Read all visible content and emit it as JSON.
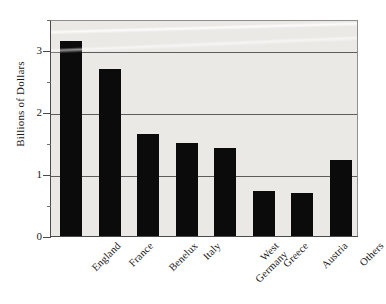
{
  "chart_data": {
    "type": "bar",
    "title": "",
    "subtitle": "",
    "xlabel": "",
    "ylabel": "Billions of Dollars",
    "categories": [
      "England",
      "France",
      "Benelux",
      "Italy",
      "West Germany",
      "Greece",
      "Austria",
      "Others"
    ],
    "values": [
      3.15,
      2.7,
      1.65,
      1.5,
      1.42,
      0.73,
      0.7,
      1.22
    ],
    "series": [
      {
        "name": "Billions of Dollars",
        "values": [
          3.15,
          2.7,
          1.65,
          1.5,
          1.42,
          0.73,
          0.7,
          1.22
        ]
      }
    ],
    "ylim": [
      0,
      3.5
    ],
    "ytick_labels": [
      "0",
      "1",
      "2",
      "3"
    ],
    "ytick_values": [
      0,
      1,
      2,
      3
    ],
    "yminor_tick_values": [
      0.5,
      1.5,
      2.5,
      3.5
    ],
    "grid": "horizontal",
    "legend": "none",
    "bar_color": "#0b0b0b",
    "plot_background": "#eae9e6",
    "figure_background": "#ffffff",
    "gridline_color": "#5d5d5d",
    "axis_color": "#4a4a4a",
    "xlabel_rotation": "-45",
    "annotations": []
  },
  "axis": {
    "y_title": "Billions of Dollars"
  }
}
